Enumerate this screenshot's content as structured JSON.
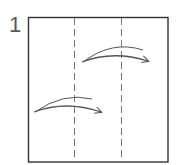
{
  "diagram": {
    "step_number": "1",
    "colors": {
      "outline": "#333333",
      "fold_line": "#777777",
      "arrow": "#555555",
      "background": "#ffffff"
    },
    "paper": {
      "x": 28,
      "y": 17,
      "width": 140,
      "height": 145
    },
    "fold_lines": [
      {
        "type": "valley-fold-dashed",
        "x": 74
      },
      {
        "type": "valley-fold-dashed",
        "x": 121
      }
    ],
    "arrows": [
      {
        "name": "fold-arrow-upper",
        "from": [
          82,
          62
        ],
        "to": [
          148,
          61
        ],
        "direction": "right"
      },
      {
        "name": "fold-arrow-lower",
        "from": [
          34,
          112
        ],
        "to": [
          101,
          112
        ],
        "direction": "right"
      }
    ]
  }
}
